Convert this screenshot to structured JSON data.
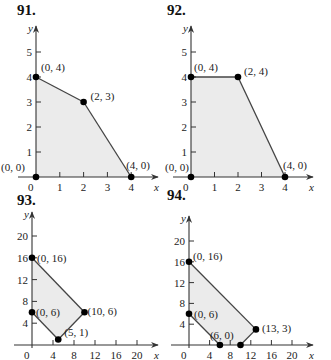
{
  "chart_data": [
    {
      "id": "91",
      "title": "91.",
      "type": "area",
      "xlabel": "x",
      "ylabel": "y",
      "xticks": [
        "0",
        "1",
        "2",
        "3",
        "4"
      ],
      "yticks": [
        "1",
        "2",
        "3",
        "4",
        "5"
      ],
      "xlim": [
        0,
        4.6
      ],
      "ylim": [
        0,
        5.7
      ],
      "fill_color": "#ebebeb",
      "vertices": [
        {
          "x": 0,
          "y": 0,
          "label": "(0, 0)"
        },
        {
          "x": 0,
          "y": 4,
          "label": "(0, 4)"
        },
        {
          "x": 2,
          "y": 3,
          "label": "(2, 3)"
        },
        {
          "x": 4,
          "y": 0,
          "label": "(4, 0)"
        }
      ]
    },
    {
      "id": "92",
      "title": "92.",
      "type": "area",
      "xlabel": "x",
      "ylabel": "y",
      "xticks": [
        "0",
        "1",
        "2",
        "3",
        "4"
      ],
      "yticks": [
        "1",
        "2",
        "3",
        "4",
        "5"
      ],
      "xlim": [
        0,
        4.6
      ],
      "ylim": [
        0,
        5.7
      ],
      "fill_color": "#ebebeb",
      "vertices": [
        {
          "x": 0,
          "y": 0,
          "label": "(0, 0)"
        },
        {
          "x": 0,
          "y": 4,
          "label": "(0, 4)"
        },
        {
          "x": 2,
          "y": 4,
          "label": "(2, 4)"
        },
        {
          "x": 4,
          "y": 0,
          "label": "(4, 0)"
        }
      ]
    },
    {
      "id": "93",
      "title": "93.",
      "type": "area",
      "xlabel": "x",
      "ylabel": "y",
      "xticks": [
        "0",
        "4",
        "8",
        "12",
        "16",
        "20"
      ],
      "yticks": [
        "4",
        "8",
        "12",
        "16",
        "20"
      ],
      "xlim": [
        0,
        22
      ],
      "ylim": [
        0,
        23
      ],
      "fill_color": "#ebebeb",
      "vertices": [
        {
          "x": 0,
          "y": 16,
          "label": "(0, 16)"
        },
        {
          "x": 10,
          "y": 6,
          "label": "(10, 6)"
        },
        {
          "x": 5,
          "y": 1,
          "label": "(5, 1)"
        },
        {
          "x": 0,
          "y": 6,
          "label": "(0, 6)"
        }
      ]
    },
    {
      "id": "94",
      "title": "94.",
      "type": "area",
      "xlabel": "x",
      "ylabel": "y",
      "xticks": [
        "0",
        "4",
        "8",
        "12",
        "16",
        "20"
      ],
      "yticks": [
        "4",
        "8",
        "12",
        "16",
        "20"
      ],
      "xlim": [
        0,
        22
      ],
      "ylim": [
        0,
        23
      ],
      "fill_color": "#ebebeb",
      "vertices": [
        {
          "x": 0,
          "y": 16,
          "label": "(0, 16)"
        },
        {
          "x": 13,
          "y": 3,
          "label": "(13, 3)"
        },
        {
          "x": 10,
          "y": 0,
          "label": ""
        },
        {
          "x": 6,
          "y": 0,
          "label": "(6, 0)"
        },
        {
          "x": 0,
          "y": 6,
          "label": "(0, 6)"
        }
      ]
    }
  ]
}
